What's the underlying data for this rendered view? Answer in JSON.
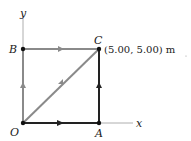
{
  "diagram": {
    "axes": {
      "x_label": "x",
      "y_label": "y"
    },
    "points": {
      "O": {
        "label": "O"
      },
      "A": {
        "label": "A"
      },
      "B": {
        "label": "B"
      },
      "C": {
        "label": "C",
        "coordinate": "(5.00, 5.00) m"
      }
    },
    "paths": [
      {
        "name": "O-A",
        "color": "#222222"
      },
      {
        "name": "A-C",
        "color": "#222222"
      },
      {
        "name": "O-B",
        "color": "#888888"
      },
      {
        "name": "B-C",
        "color": "#888888"
      },
      {
        "name": "O-C",
        "color": "#888888"
      }
    ],
    "dot_label": "."
  }
}
